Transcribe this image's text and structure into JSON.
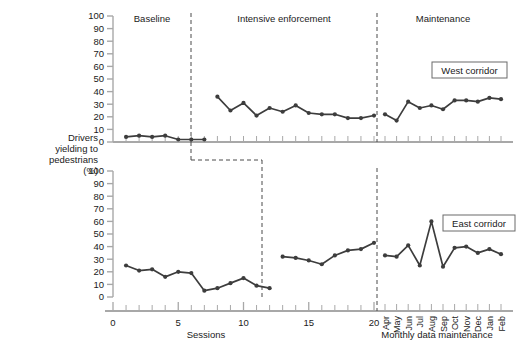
{
  "figure": {
    "y_axis_label_lines": [
      "Drivers",
      "yielding to",
      "pedestrians",
      "(%)"
    ],
    "x_axis_label_left": "Sessions",
    "x_axis_label_right": "Monthly data maintenance",
    "phases": [
      "Baseline",
      "Intensive enforcement",
      "Maintenance"
    ],
    "series_labels": [
      "West corridor",
      "East corridor"
    ],
    "accent_color": "#3d3d3d",
    "axis_color": "#a8a8a8",
    "marker_color": "#3d3d3d"
  },
  "chart_data": [
    {
      "type": "line",
      "title": "West corridor",
      "xlabel": "Sessions / Monthly data maintenance",
      "ylabel": "Drivers yielding to pedestrians (%)",
      "ylim": [
        0,
        100
      ],
      "ytick_labels": [
        "0",
        "10",
        "20",
        "30",
        "40",
        "50",
        "60",
        "70",
        "80",
        "90",
        "100"
      ],
      "ytick_values": [
        0,
        10,
        20,
        30,
        40,
        50,
        60,
        70,
        80,
        90,
        100
      ],
      "xtick_labels": [
        "0",
        "5",
        "10",
        "15",
        "20"
      ],
      "grid": false,
      "legend_position": "inside-right",
      "phase_dividers": [
        12.5,
        20.5
      ],
      "phases": [
        {
          "name": "Baseline",
          "x": [
            1,
            2,
            3,
            4,
            5,
            6,
            7
          ],
          "values": [
            4,
            5,
            4,
            5,
            2,
            2,
            2
          ]
        },
        {
          "name": "Intensive enforcement",
          "x": [
            8,
            9,
            10,
            11,
            12,
            13,
            14,
            15,
            16,
            17,
            18,
            19,
            20
          ],
          "values": [
            36,
            25,
            31,
            21,
            27,
            24,
            29,
            23,
            22,
            22,
            19,
            19,
            21
          ]
        },
        {
          "name": "Maintenance",
          "x": [
            "Apr",
            "May",
            "Jun",
            "Jul",
            "Aug",
            "Sep",
            "Oct",
            "Nov",
            "Dec",
            "Jan",
            "Feb"
          ],
          "values": [
            22,
            17,
            32,
            27,
            29,
            26,
            33,
            33,
            32,
            35,
            34
          ]
        }
      ]
    },
    {
      "type": "line",
      "title": "East corridor",
      "xlabel": "Sessions / Monthly data maintenance",
      "ylabel": "Drivers yielding to pedestrians (%)",
      "ylim": [
        0,
        100
      ],
      "ytick_labels": [
        "0",
        "10",
        "20",
        "30",
        "40",
        "50",
        "60",
        "70",
        "80",
        "90",
        "100"
      ],
      "ytick_values": [
        0,
        10,
        20,
        30,
        40,
        50,
        60,
        70,
        80,
        90,
        100
      ],
      "xtick_labels": [
        "0",
        "5",
        "10",
        "15",
        "20"
      ],
      "grid": false,
      "legend_position": "inside-right",
      "phase_dividers": [
        12.5,
        20.5
      ],
      "phases": [
        {
          "name": "Baseline",
          "x": [
            1,
            2,
            3,
            4,
            5,
            6,
            7,
            8,
            9,
            10,
            11,
            12
          ],
          "values": [
            25,
            21,
            22,
            16,
            20,
            19,
            5,
            7,
            11,
            15,
            9,
            7
          ]
        },
        {
          "name": "Intensive enforcement",
          "x": [
            13,
            14,
            15,
            16,
            17,
            18,
            19,
            20
          ],
          "values": [
            32,
            31,
            29,
            26,
            33,
            37,
            38,
            43
          ]
        },
        {
          "name": "Maintenance",
          "x": [
            "Apr",
            "May",
            "Jun",
            "Jul",
            "Aug",
            "Sep",
            "Oct",
            "Nov",
            "Dec",
            "Jan",
            "Feb"
          ],
          "values": [
            33,
            32,
            41,
            25,
            60,
            24,
            39,
            40,
            35,
            38,
            34
          ]
        }
      ]
    }
  ],
  "months": [
    "Apr",
    "May",
    "Jun",
    "Jul",
    "Aug",
    "Sep",
    "Oct",
    "Nov",
    "Dec",
    "Jan",
    "Feb"
  ]
}
